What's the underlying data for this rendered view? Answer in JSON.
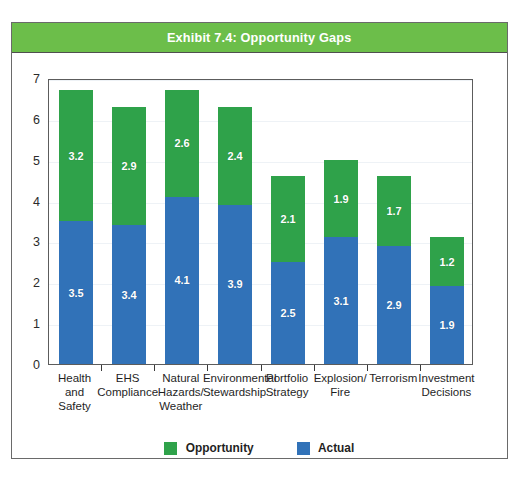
{
  "figure": {
    "title": "Exhibit 7.4: Opportunity Gaps",
    "title_bar_color": "#6CBE4A",
    "border_color": "#6A6A6A"
  },
  "chart_data": {
    "type": "bar",
    "stacked": true,
    "title": "Exhibit 7.4: Opportunity Gaps",
    "xlabel": "",
    "ylabel": "",
    "ylim": [
      0,
      7
    ],
    "yticks": [
      0,
      1,
      2,
      3,
      4,
      5,
      6,
      7
    ],
    "ytick_labels": [
      "0",
      "1",
      "2",
      "3",
      "4",
      "5",
      "6",
      "7"
    ],
    "grid": true,
    "legend_position": "bottom",
    "categories": [
      "Health and Safety",
      "EHS Compliance",
      "Natural Hazards/ Weather",
      "Environmental Stewardship",
      "Portfolio Strategy",
      "Explosion/ Fire",
      "Terrorism",
      "Investment Decisions"
    ],
    "category_lines": [
      [
        "Health",
        "and",
        "Safety"
      ],
      [
        "EHS",
        "Compliance"
      ],
      [
        "Natural",
        "Hazards/",
        "Weather"
      ],
      [
        "Environmental",
        "Stewardship"
      ],
      [
        "Portfolio",
        "Strategy"
      ],
      [
        "Explosion/",
        "Fire"
      ],
      [
        "Terrorism"
      ],
      [
        "Investment",
        "Decisions"
      ]
    ],
    "series": [
      {
        "name": "Actual",
        "color": "#3172B8",
        "values": [
          3.5,
          3.4,
          4.1,
          3.9,
          2.5,
          3.1,
          2.9,
          1.9
        ]
      },
      {
        "name": "Opportunity",
        "color": "#2FA24A",
        "values": [
          3.2,
          2.9,
          2.6,
          2.4,
          2.1,
          1.9,
          1.7,
          1.2
        ]
      }
    ],
    "totals": [
      6.7,
      6.3,
      6.7,
      6.3,
      4.6,
      5.0,
      4.6,
      3.1
    ]
  },
  "legend": {
    "items": [
      {
        "label": "Opportunity",
        "color": "#2FA24A"
      },
      {
        "label": "Actual",
        "color": "#3172B8"
      }
    ]
  }
}
